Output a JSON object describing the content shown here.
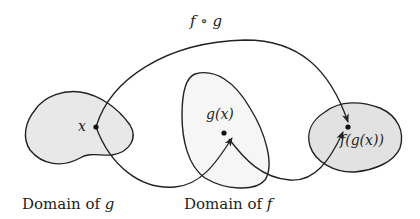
{
  "diagram": {
    "title_label": "f ∘ g",
    "points": {
      "x": "x",
      "gx": "g(x)",
      "fgx": "f(g(x))"
    },
    "captions": {
      "domain_g_prefix": "Domain of ",
      "domain_g_var": "g",
      "domain_f_prefix": "Domain of ",
      "domain_f_var": "f"
    },
    "colors": {
      "region_fill": "#e8e8e8",
      "line": "#222222",
      "background": "#ffffff"
    }
  }
}
